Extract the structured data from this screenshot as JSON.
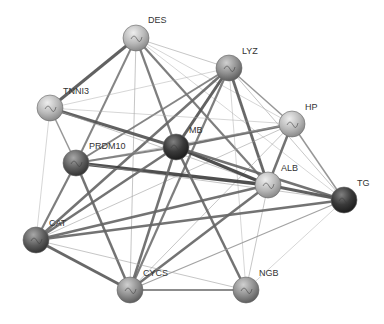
{
  "network": {
    "nodes": [
      {
        "id": "DES",
        "label": "DES",
        "x": 136,
        "y": 38,
        "shade": "light",
        "lx": 148,
        "ly": 23
      },
      {
        "id": "LYZ",
        "label": "LYZ",
        "x": 229,
        "y": 68,
        "shade": "mid",
        "lx": 242,
        "ly": 54
      },
      {
        "id": "TNNI3",
        "label": "TNNI3",
        "x": 50,
        "y": 108,
        "shade": "light",
        "lx": 63,
        "ly": 94
      },
      {
        "id": "HP",
        "label": "HP",
        "x": 292,
        "y": 124,
        "shade": "light",
        "lx": 305,
        "ly": 110
      },
      {
        "id": "PRDM10",
        "label": "PRDM10",
        "x": 76,
        "y": 163,
        "shade": "dark",
        "lx": 89,
        "ly": 149
      },
      {
        "id": "MB",
        "label": "MB",
        "x": 176,
        "y": 147,
        "shade": "darkest",
        "lx": 189,
        "ly": 133
      },
      {
        "id": "ALB",
        "label": "ALB",
        "x": 268,
        "y": 185,
        "shade": "light",
        "lx": 281,
        "ly": 171
      },
      {
        "id": "TG",
        "label": "TG",
        "x": 344,
        "y": 200,
        "shade": "darkest",
        "lx": 357,
        "ly": 186
      },
      {
        "id": "CAT",
        "label": "CAT",
        "x": 36,
        "y": 240,
        "shade": "dark",
        "lx": 49,
        "ly": 226
      },
      {
        "id": "CYCS",
        "label": "CYCS",
        "x": 130,
        "y": 290,
        "shade": "mid",
        "lx": 143,
        "ly": 276
      },
      {
        "id": "NGB",
        "label": "NGB",
        "x": 246,
        "y": 290,
        "shade": "mid",
        "lx": 259,
        "ly": 276
      }
    ],
    "edges": [
      [
        "DES",
        "TNNI3",
        3
      ],
      [
        "DES",
        "PRDM10",
        2
      ],
      [
        "DES",
        "MB",
        2.2
      ],
      [
        "DES",
        "ALB",
        2.2
      ],
      [
        "DES",
        "CYCS",
        1
      ],
      [
        "DES",
        "HP",
        0.8
      ],
      [
        "DES",
        "TG",
        0.8
      ],
      [
        "DES",
        "LYZ",
        1
      ],
      [
        "LYZ",
        "MB",
        3
      ],
      [
        "LYZ",
        "PRDM10",
        2
      ],
      [
        "LYZ",
        "CAT",
        2.5
      ],
      [
        "LYZ",
        "CYCS",
        2.2
      ],
      [
        "LYZ",
        "ALB",
        2.8
      ],
      [
        "LYZ",
        "HP",
        1.5
      ],
      [
        "LYZ",
        "TG",
        1
      ],
      [
        "LYZ",
        "TNNI3",
        0.8
      ],
      [
        "LYZ",
        "NGB",
        0.8
      ],
      [
        "TNNI3",
        "MB",
        3
      ],
      [
        "TNNI3",
        "PRDM10",
        1.5
      ],
      [
        "TNNI3",
        "CAT",
        0.8
      ],
      [
        "TNNI3",
        "ALB",
        1
      ],
      [
        "TNNI3",
        "HP",
        0.8
      ],
      [
        "HP",
        "MB",
        2.5
      ],
      [
        "HP",
        "ALB",
        2.5
      ],
      [
        "HP",
        "TG",
        1.5
      ],
      [
        "HP",
        "CAT",
        1
      ],
      [
        "HP",
        "CYCS",
        1
      ],
      [
        "HP",
        "PRDM10",
        1
      ],
      [
        "PRDM10",
        "MB",
        2
      ],
      [
        "PRDM10",
        "ALB",
        3.5
      ],
      [
        "PRDM10",
        "CAT",
        2.2
      ],
      [
        "PRDM10",
        "CYCS",
        2.5
      ],
      [
        "PRDM10",
        "TG",
        1
      ],
      [
        "MB",
        "ALB",
        3.5
      ],
      [
        "MB",
        "TG",
        2.5
      ],
      [
        "MB",
        "CAT",
        2.5
      ],
      [
        "MB",
        "CYCS",
        2.5
      ],
      [
        "MB",
        "NGB",
        2.5
      ],
      [
        "ALB",
        "TG",
        3
      ],
      [
        "ALB",
        "CAT",
        2.5
      ],
      [
        "ALB",
        "CYCS",
        2.5
      ],
      [
        "ALB",
        "NGB",
        1
      ],
      [
        "TG",
        "CAT",
        2.5
      ],
      [
        "TG",
        "CYCS",
        1.2
      ],
      [
        "TG",
        "NGB",
        0.8
      ],
      [
        "CAT",
        "CYCS",
        2.8
      ],
      [
        "CAT",
        "NGB",
        1
      ],
      [
        "CYCS",
        "NGB",
        1.8
      ]
    ]
  }
}
